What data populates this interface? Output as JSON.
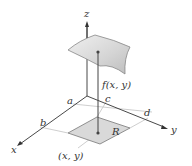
{
  "diagram": {
    "type": "3d-surface-over-region",
    "axes": {
      "x_label": "x",
      "y_label": "y",
      "z_label": "z"
    },
    "interval_labels": {
      "a": "a",
      "b": "b",
      "c": "c",
      "d": "d"
    },
    "region_label": "R",
    "height_label": "f(x, y)",
    "point_label": "(x, y)",
    "colors": {
      "axis": "#333333",
      "surface_fill": "#d6d6d6",
      "surface_stroke": "#888888",
      "region_fill": "#d9d9d9",
      "grid_line": "#c8c8c8",
      "point": "#444444"
    }
  }
}
